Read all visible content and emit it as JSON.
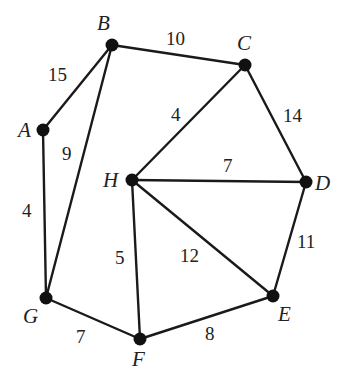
{
  "diagram": {
    "type": "weighted-undirected-graph",
    "nodes": [
      {
        "id": "A",
        "label": "A",
        "x": 43,
        "y": 130,
        "lx": 18,
        "ly": 137
      },
      {
        "id": "B",
        "label": "B",
        "x": 112,
        "y": 45,
        "lx": 97,
        "ly": 30
      },
      {
        "id": "C",
        "label": "C",
        "x": 245,
        "y": 65,
        "lx": 237,
        "ly": 50
      },
      {
        "id": "D",
        "label": "D",
        "x": 306,
        "y": 182,
        "lx": 315,
        "ly": 190
      },
      {
        "id": "E",
        "label": "E",
        "x": 273,
        "y": 296,
        "lx": 278,
        "ly": 321
      },
      {
        "id": "F",
        "label": "F",
        "x": 140,
        "y": 339,
        "lx": 132,
        "ly": 366
      },
      {
        "id": "G",
        "label": "G",
        "x": 46,
        "y": 298,
        "lx": 23,
        "ly": 323
      },
      {
        "id": "H",
        "label": "H",
        "x": 132,
        "y": 180,
        "lx": 103,
        "ly": 187
      }
    ],
    "edges": [
      {
        "from": "A",
        "to": "B",
        "weight": "15",
        "lx": 48,
        "ly": 81
      },
      {
        "from": "B",
        "to": "C",
        "weight": "10",
        "lx": 166,
        "ly": 45
      },
      {
        "from": "B",
        "to": "G",
        "weight": "9",
        "lx": 62,
        "ly": 160
      },
      {
        "from": "A",
        "to": "G",
        "weight": "4",
        "lx": 22,
        "ly": 217
      },
      {
        "from": "C",
        "to": "H",
        "weight": "4",
        "lx": 171,
        "ly": 121
      },
      {
        "from": "C",
        "to": "D",
        "weight": "14",
        "lx": 283,
        "ly": 122
      },
      {
        "from": "H",
        "to": "D",
        "weight": "7",
        "lx": 223,
        "ly": 172
      },
      {
        "from": "H",
        "to": "E",
        "weight": "12",
        "lx": 180,
        "ly": 262
      },
      {
        "from": "H",
        "to": "F",
        "weight": "5",
        "lx": 115,
        "ly": 264
      },
      {
        "from": "D",
        "to": "E",
        "weight": "11",
        "lx": 297,
        "ly": 248
      },
      {
        "from": "G",
        "to": "F",
        "weight": "7",
        "lx": 76,
        "ly": 343
      },
      {
        "from": "F",
        "to": "E",
        "weight": "8",
        "lx": 205,
        "ly": 340
      }
    ],
    "colors": {
      "edge": "#1a1a1a",
      "node": "#111111",
      "text": "#222222",
      "background": "#ffffff"
    }
  }
}
